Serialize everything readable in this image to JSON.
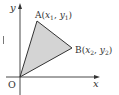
{
  "diagram": {
    "axes": {
      "x_label": "x",
      "y_label": "y",
      "origin_label": "O"
    },
    "points": {
      "A": {
        "name": "A",
        "label_open": "(",
        "coord1": "x",
        "sub1": "1",
        "sep": ", ",
        "coord2": "y",
        "sub2": "1",
        "label_close": ")"
      },
      "B": {
        "name": "B",
        "label_open": "(",
        "coord1": "x",
        "sub1": "2",
        "sep": ", ",
        "coord2": "y",
        "sub2": "2",
        "label_close": ")"
      }
    },
    "colors": {
      "fill": "#d4d4d4",
      "stroke": "#333333",
      "background": "#ffffff"
    }
  }
}
